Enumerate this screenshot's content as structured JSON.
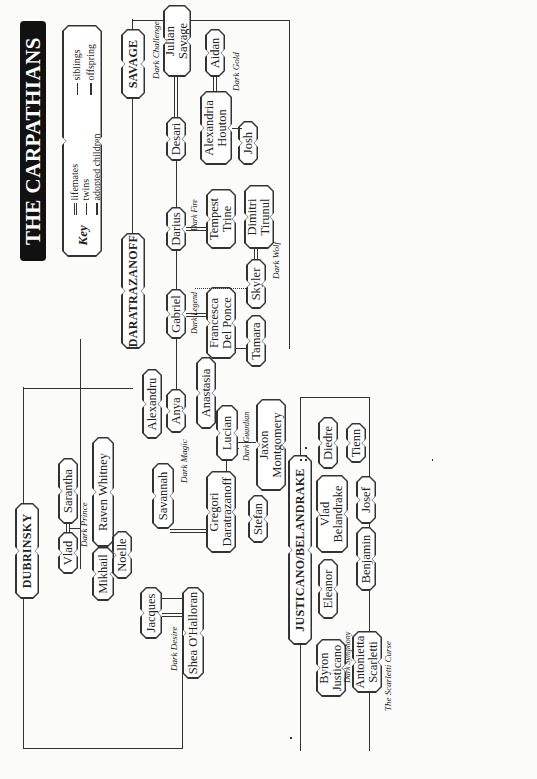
{
  "title": "THE CARPATHIANS",
  "key": {
    "label": "Key",
    "items": [
      {
        "symbol": "double-line",
        "label": "lifemates"
      },
      {
        "symbol": "twin-mark",
        "label": "twins"
      },
      {
        "symbol": "dotted-offspring",
        "label": "adopted children"
      },
      {
        "symbol": "single-line",
        "label": "siblings"
      },
      {
        "symbol": "t-line",
        "label": "offspring"
      }
    ]
  },
  "families": {
    "savage": "SAVAGE",
    "daratrazanoff": "DARATRAZANOFF",
    "dubrinsky": "DUBRINSKY",
    "justicano": "JUSTICANO/BELANDRAKE",
    "others": "OTHER CARPATHIAN LIFEMATES"
  },
  "people": {
    "julian": "Julian Savage",
    "aidan": "Aidan",
    "desari": "Desari",
    "alexandria": "Alexandria Houton",
    "josh": "Josh",
    "darius": "Darius",
    "tempest": "Tempest Trine",
    "dimitri": "Dimitri Tirunul",
    "skyler": "Skyler",
    "gabriel": "Gabriel",
    "francesca": "Francesca Del Ponce",
    "tamara": "Tamara",
    "alexandru": "Alexandru",
    "anya": "Anya",
    "anastasia": "Anastasia",
    "lucian": "Lucian",
    "jaxon": "Jaxon Montgomery",
    "gregori": "Gregori Daratrazanoff",
    "stefan": "Stefan",
    "savannah": "Savannah",
    "raven": "Raven Whitney",
    "mikhail": "Mikhail",
    "jacques": "Jacques",
    "shea": "Shea O'Halloran",
    "vlad": "Vlad",
    "sarantha": "Sarantha",
    "noelle": "Noelle",
    "diedre": "Diedre",
    "tienn": "Tienn",
    "vlad_b": "Vlad Belandrake",
    "josef": "Josef",
    "benjamin": "Benjamin",
    "eleanor": "Eleanor",
    "byron": "Byron Justicano",
    "antonietta": "Antonietta Scarletti",
    "syndil": "Syndil",
    "barack": "Barack",
    "corrine": "Corrine Wentworth",
    "dayan": "Dayan",
    "jennifer": "Jennifer",
    "sara": "Sara Marten",
    "falcon": "Falcon",
    "joie": "Joie Sanders",
    "traian": "Traian Trigovise",
    "jubal": "Jubal",
    "gabrielle": "Gabrielle",
    "riley": "Riley Parker",
    "dax": "Danutdaxton “Dax”",
    "eric": "Eric",
    "celeste": "Celeste"
  },
  "books": {
    "dark_challenge": "Dark Challenge",
    "dark_gold": "Dark Gold",
    "dark_fire_1": "Dark Fire",
    "dark_wolf": "Dark Wolf",
    "dark_legend": "Dark Legend",
    "dark_guardian": "Dark Guardian",
    "dark_magic": "Dark Magic",
    "dark_prince": "Dark Prince",
    "dark_desire": "Dark Desire",
    "dark_symphony": "Dark Symphony",
    "scarletti_curse": "The Scarletti Curse",
    "dark_fire_2": "Dark Fire",
    "dark_melody": "Dark Melody",
    "dark_dream": "Dark Dream/After Twilight",
    "dark_descent": "Dark Descent/The Only One",
    "dark_storm": "Dark Storm"
  }
}
